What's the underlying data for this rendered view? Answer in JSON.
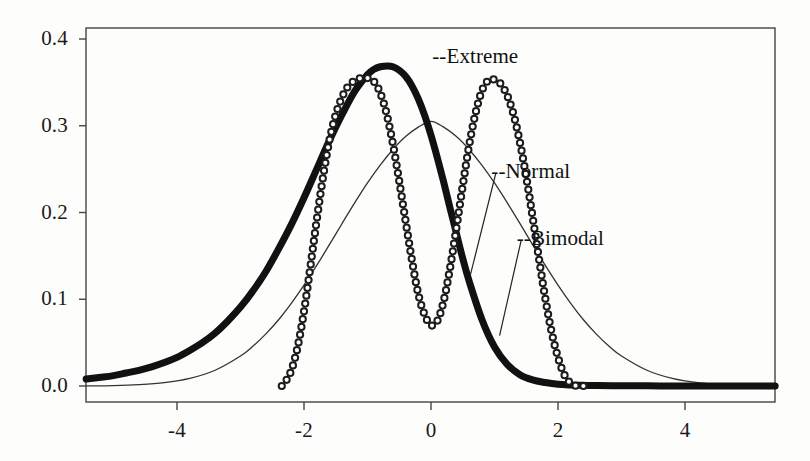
{
  "chart_data": {
    "type": "line",
    "title": "",
    "subtitle": "",
    "xlabel": "",
    "ylabel": "",
    "xlim": [
      -5.43,
      5.42
    ],
    "ylim": [
      0.0,
      0.42
    ],
    "grid": false,
    "legend_position": "inline-annotations",
    "x_ticks": [
      -4,
      -2,
      0,
      2,
      4
    ],
    "x_tick_labels": [
      "-4",
      "-2",
      "0",
      "2",
      "4"
    ],
    "y_ticks": [
      0.0,
      0.1,
      0.2,
      0.3,
      0.4
    ],
    "y_tick_labels": [
      "0.0",
      "0.1",
      "0.2",
      "0.3",
      "0.4"
    ],
    "series": [
      {
        "name": "Extreme",
        "style": "thick-solid-black",
        "color": "#111111",
        "line_width": 7,
        "peak_x": -0.68,
        "peak_y": 0.369,
        "annotation": "--Extreme",
        "annotation_x": 0.02,
        "annotation_y": 0.378,
        "x": [
          -5.43,
          -5.2,
          -5.0,
          -4.8,
          -4.6,
          -4.4,
          -4.2,
          -4.0,
          -3.8,
          -3.6,
          -3.4,
          -3.2,
          -3.0,
          -2.8,
          -2.6,
          -2.4,
          -2.2,
          -2.0,
          -1.8,
          -1.6,
          -1.4,
          -1.2,
          -1.0,
          -0.9,
          -0.8,
          -0.68,
          -0.6,
          -0.5,
          -0.4,
          -0.3,
          -0.2,
          -0.1,
          0.0,
          0.1,
          0.2,
          0.3,
          0.4,
          0.5,
          0.6,
          0.8,
          1.0,
          1.2,
          1.4,
          1.6,
          1.8,
          2.0,
          2.2,
          2.4,
          2.6,
          3.0,
          3.4,
          3.8,
          4.2,
          4.6,
          5.0,
          5.42
        ],
        "y": [
          0.008,
          0.01,
          0.012,
          0.015,
          0.018,
          0.022,
          0.027,
          0.033,
          0.041,
          0.05,
          0.061,
          0.075,
          0.091,
          0.11,
          0.132,
          0.158,
          0.186,
          0.217,
          0.25,
          0.283,
          0.313,
          0.34,
          0.359,
          0.365,
          0.368,
          0.369,
          0.368,
          0.364,
          0.357,
          0.346,
          0.331,
          0.312,
          0.289,
          0.263,
          0.235,
          0.205,
          0.176,
          0.147,
          0.121,
          0.077,
          0.045,
          0.025,
          0.013,
          0.007,
          0.004,
          0.002,
          0.0012,
          0.0008,
          0.0005,
          0.0003,
          0.0002,
          0.0001,
          0.0001,
          0.0,
          0.0,
          0.0
        ]
      },
      {
        "name": "Bimodal",
        "style": "open-circle-markers",
        "color": "#1c1c1c",
        "marker": "circle",
        "marker_size": 5,
        "peaks": [
          {
            "x": -1.0,
            "y": 0.355
          },
          {
            "x": 0.91,
            "y": 0.353
          }
        ],
        "trough": {
          "x": 0.0,
          "y": 0.07
        },
        "annotation": "--Bimodal",
        "annotation_x": 1.35,
        "annotation_y": 0.168,
        "x": [
          -2.35,
          -2.3,
          -2.2,
          -2.1,
          -2.0,
          -1.9,
          -1.8,
          -1.7,
          -1.6,
          -1.5,
          -1.4,
          -1.3,
          -1.2,
          -1.1,
          -1.0,
          -0.9,
          -0.8,
          -0.7,
          -0.6,
          -0.5,
          -0.4,
          -0.3,
          -0.2,
          -0.1,
          0.0,
          0.1,
          0.2,
          0.3,
          0.4,
          0.5,
          0.6,
          0.7,
          0.8,
          0.91,
          1.0,
          1.1,
          1.2,
          1.3,
          1.4,
          1.5,
          1.6,
          1.7,
          1.8,
          1.9,
          2.0,
          2.1,
          2.2,
          2.3,
          2.4
        ],
        "y": [
          0.0,
          0.004,
          0.018,
          0.045,
          0.086,
          0.137,
          0.191,
          0.241,
          0.283,
          0.313,
          0.333,
          0.346,
          0.352,
          0.355,
          0.355,
          0.351,
          0.338,
          0.314,
          0.279,
          0.236,
          0.19,
          0.145,
          0.106,
          0.082,
          0.07,
          0.075,
          0.098,
          0.136,
          0.182,
          0.231,
          0.277,
          0.314,
          0.34,
          0.353,
          0.353,
          0.348,
          0.335,
          0.313,
          0.281,
          0.241,
          0.195,
          0.147,
          0.101,
          0.062,
          0.033,
          0.013,
          0.003,
          0.0,
          0.0
        ]
      },
      {
        "name": "Normal",
        "style": "thin-solid-line",
        "color": "#333333",
        "line_width": 1.3,
        "peak_x": 0.0,
        "peak_y": 0.305,
        "sigma": 1.31,
        "annotation": "--Normal",
        "annotation_x": 0.95,
        "annotation_y": 0.245,
        "x": [
          -5.43,
          -5.0,
          -4.6,
          -4.2,
          -3.8,
          -3.4,
          -3.0,
          -2.8,
          -2.6,
          -2.4,
          -2.2,
          -2.0,
          -1.8,
          -1.6,
          -1.4,
          -1.2,
          -1.0,
          -0.8,
          -0.6,
          -0.4,
          -0.2,
          0.0,
          0.2,
          0.4,
          0.6,
          0.8,
          1.0,
          1.2,
          1.4,
          1.6,
          1.8,
          2.0,
          2.2,
          2.4,
          2.6,
          2.8,
          3.0,
          3.4,
          3.8,
          4.2,
          4.6,
          5.0,
          5.42
        ],
        "y": [
          0.0001,
          0.0003,
          0.0009,
          0.0022,
          0.005,
          0.0104,
          0.0198,
          0.0264,
          0.0344,
          0.0437,
          0.0545,
          0.0665,
          0.0795,
          0.0932,
          0.1072,
          0.1209,
          0.1339,
          0.1457,
          0.156,
          0.1645,
          0.1707,
          0.1745,
          0.1707,
          0.1645,
          0.156,
          0.1457,
          0.1339,
          0.1209,
          0.1072,
          0.0932,
          0.0795,
          0.0665,
          0.0545,
          0.0437,
          0.0344,
          0.0264,
          0.0198,
          0.0104,
          0.005,
          0.0022,
          0.0009,
          0.0003,
          0.0001
        ],
        "y_scale_note": "rendered scaled so peak reads 0.305"
      }
    ]
  },
  "axes": {
    "frame_color": "#444444",
    "tick_color": "#444444"
  }
}
